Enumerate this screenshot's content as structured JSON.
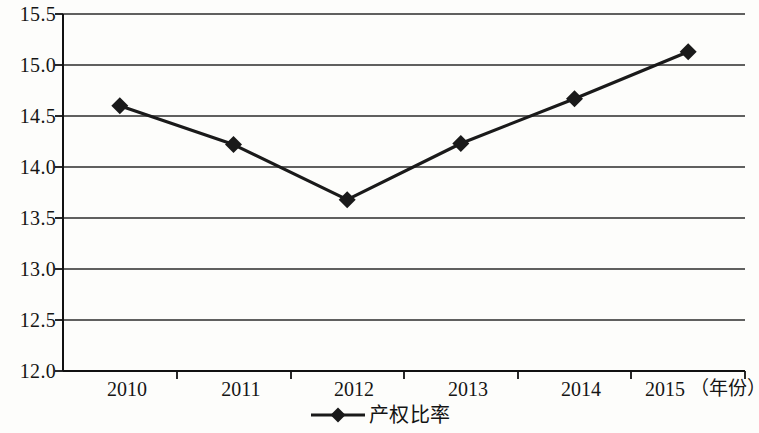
{
  "chart_data": {
    "type": "line",
    "title": "",
    "subtitle": "",
    "xlabel": "年份",
    "ylabel": "",
    "categories": [
      "2010",
      "2011",
      "2012",
      "2013",
      "2014",
      "2015"
    ],
    "series": [
      {
        "name": "产权比率",
        "values": [
          14.6,
          14.22,
          13.68,
          14.23,
          14.67,
          15.13
        ],
        "color": "#1a1a1a",
        "marker": "diamond"
      }
    ],
    "ylim": [
      12.0,
      15.5
    ],
    "yticks": [
      "15.5",
      "15.0",
      "14.5",
      "14.0",
      "13.5",
      "13.0",
      "12.5",
      "12.0"
    ],
    "ytick_values": [
      15.5,
      15.0,
      14.5,
      14.0,
      13.5,
      13.0,
      12.5,
      12.0
    ],
    "grid": true,
    "grid_axis": "y",
    "legend_position": "bottom-center",
    "x_axis_unit_label": "（年份）"
  },
  "legend": {
    "entries": [
      {
        "label": "产权比率",
        "marker": "diamond-line-marker"
      }
    ]
  },
  "axes": {
    "x_labels": [
      "2010",
      "2011",
      "2012",
      "2013",
      "2014",
      "2015"
    ],
    "x_unit": "（年份）",
    "y_labels": [
      "15.5",
      "15.0",
      "14.5",
      "14.0",
      "13.5",
      "13.0",
      "12.5",
      "12.0"
    ]
  },
  "colors": {
    "line": "#1a1a1a",
    "grid": "#2b2b2b",
    "axis": "#111111",
    "background": "#fdfdfb",
    "text": "#151515"
  }
}
